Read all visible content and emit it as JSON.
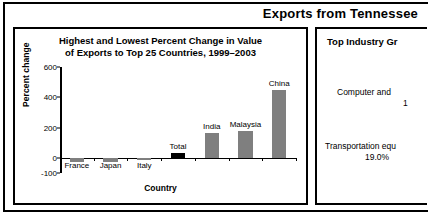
{
  "banner": {
    "title": "Exports from Tennessee"
  },
  "left_panel": {
    "title_line1": "Highest and Lowest Percent Change in Value",
    "title_line2": "of Exports to Top 25 Countries, 1999–2003"
  },
  "right_panel": {
    "title": "Top Industry Gr",
    "items": [
      {
        "label": "Computer and",
        "value": "1"
      },
      {
        "label": "Transportation equ",
        "value": "19.0%"
      }
    ]
  },
  "chart_data": {
    "type": "bar",
    "title": "Highest and Lowest Percent Change in Value of Exports to Top 25 Countries, 1999–2003",
    "xlabel": "Country",
    "ylabel": "Percent change",
    "categories": [
      "France",
      "Japan",
      "Italy",
      "Total",
      "India",
      "Malaysia",
      "China"
    ],
    "values": [
      -30,
      -28,
      -12,
      33,
      165,
      175,
      445
    ],
    "ylim": [
      -100,
      600
    ],
    "yticks": [
      -100,
      0,
      200,
      400,
      600
    ],
    "ytick_labels": [
      "-100",
      "0",
      "200",
      "400",
      "600"
    ],
    "grid": false,
    "legend": "none",
    "series_colors": {
      "default": "#7f7f7f",
      "total": "#000000"
    },
    "highlight_category": "Total"
  }
}
